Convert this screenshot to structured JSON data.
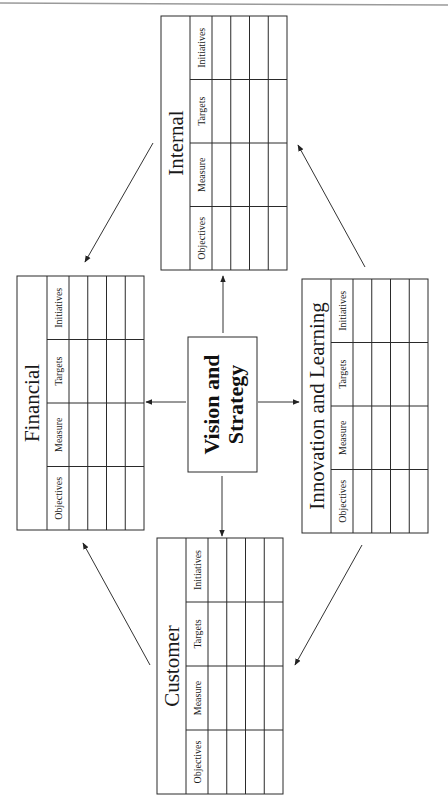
{
  "diagram": {
    "center": {
      "lines": [
        "Vision and",
        "Strategy"
      ]
    },
    "columns": [
      "Objectives",
      "Measure",
      "Targets",
      "Initiatives"
    ],
    "perspectives": [
      {
        "id": "internal",
        "title": "Internal",
        "position": "top"
      },
      {
        "id": "financial",
        "title": "Financial",
        "position": "left"
      },
      {
        "id": "innovation",
        "title": "Innovation and Learning",
        "position": "right"
      },
      {
        "id": "customer",
        "title": "Customer",
        "position": "bottom"
      }
    ],
    "data_rows_per_table": 4,
    "flows": [
      {
        "from": "vision",
        "to": "internal"
      },
      {
        "from": "vision",
        "to": "financial"
      },
      {
        "from": "vision",
        "to": "innovation"
      },
      {
        "from": "vision",
        "to": "customer"
      },
      {
        "from": "internal",
        "to": "financial"
      },
      {
        "from": "financial",
        "to": "customer"
      },
      {
        "from": "customer",
        "to": "innovation"
      },
      {
        "from": "innovation",
        "to": "internal"
      }
    ]
  }
}
